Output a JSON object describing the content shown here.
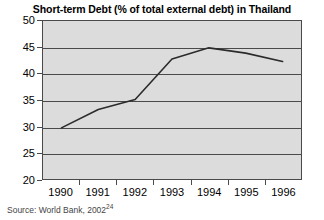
{
  "chart_data": {
    "type": "line",
    "title": "Short-term Debt (% of total external debt) in Thailand",
    "xlabel": "",
    "ylabel": "",
    "categories": [
      "1990",
      "1991",
      "1992",
      "1993",
      "1994",
      "1995",
      "1996"
    ],
    "x": [
      1990,
      1991,
      1992,
      1993,
      1994,
      1995,
      1996
    ],
    "values": [
      29.7,
      33.2,
      35.1,
      42.8,
      44.9,
      43.9,
      42.3
    ],
    "series": [
      {
        "name": "Short-term debt share",
        "values": [
          29.7,
          33.2,
          35.1,
          42.8,
          44.9,
          43.9,
          42.3
        ]
      }
    ],
    "ylim": [
      20,
      50
    ],
    "yticks": [
      20,
      25,
      30,
      35,
      40,
      45,
      50
    ],
    "ytick_labels": [
      "20",
      "25",
      "30",
      "35",
      "40",
      "45",
      "50"
    ],
    "xtick_labels": [
      "1990",
      "1991",
      "1992",
      "1993",
      "1994",
      "1995",
      "1996"
    ],
    "grid": "horizontal",
    "legend": "none",
    "line_color": "#2b2b2b",
    "plot_background": "#dcdcdc",
    "axis_color": "#4a4a4a"
  },
  "source": {
    "text": "Source: World Bank, 2002",
    "footnote_marker": "24"
  }
}
